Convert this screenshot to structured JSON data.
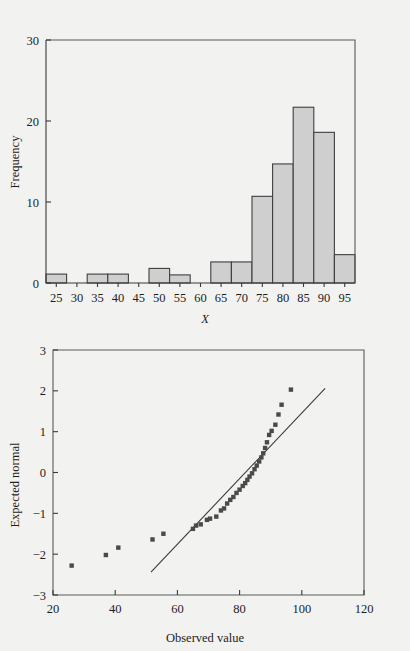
{
  "figure": {
    "background_color": "#f2f2f0",
    "bar_fill_color": "#cfcfcf",
    "bar_stroke_color": "#3f3f3f",
    "point_color": "#4a4a4a",
    "axis_color": "#3a3a3a"
  },
  "chart_data": [
    {
      "id": "histogram",
      "type": "bar",
      "title": "",
      "xlabel": "X",
      "ylabel": "Frequency",
      "xlim": [
        22.5,
        97.5
      ],
      "ylim": [
        0,
        30
      ],
      "grid": false,
      "legend": null,
      "xticks": [
        25,
        30,
        35,
        40,
        45,
        50,
        55,
        60,
        65,
        70,
        75,
        80,
        85,
        90,
        95
      ],
      "xticklabels": [
        "25",
        "30",
        "35",
        "40",
        "45",
        "50",
        "55",
        "60",
        "65",
        "70",
        "75",
        "80",
        "85",
        "90",
        "95"
      ],
      "yticks": [
        0,
        10,
        20,
        30
      ],
      "yticklabels": [
        "0",
        "10",
        "20",
        "30"
      ],
      "bin_width": 5,
      "bin_starts": [
        22.5,
        27.5,
        32.5,
        37.5,
        42.5,
        47.5,
        52.5,
        57.5,
        62.5,
        67.5,
        72.5,
        77.5,
        82.5,
        87.5,
        92.5
      ],
      "categories": [
        "25",
        "30",
        "35",
        "40",
        "45",
        "50",
        "55",
        "60",
        "65",
        "70",
        "75",
        "80",
        "85",
        "90",
        "95"
      ],
      "values": [
        1.1,
        0,
        1.1,
        1.1,
        0,
        1.8,
        1.0,
        0,
        2.6,
        2.6,
        10.7,
        14.7,
        21.7,
        18.6,
        3.5
      ]
    },
    {
      "id": "qq-plot",
      "type": "scatter",
      "title": "",
      "xlabel": "Observed value",
      "ylabel": "Expected normal",
      "xlim": [
        20,
        120
      ],
      "ylim": [
        -3,
        3
      ],
      "grid": false,
      "legend": null,
      "xticks": [
        20,
        40,
        60,
        80,
        100,
        120
      ],
      "xticklabels": [
        "20",
        "40",
        "60",
        "80",
        "100",
        "120"
      ],
      "yticks": [
        -3,
        -2,
        -1,
        0,
        1,
        2,
        3
      ],
      "yticklabels": [
        "−3",
        "−2",
        "−1",
        "0",
        "1",
        "2",
        "3"
      ],
      "points": [
        [
          26.0,
          -2.28
        ],
        [
          37.0,
          -2.02
        ],
        [
          41.0,
          -1.84
        ],
        [
          52.0,
          -1.64
        ],
        [
          55.5,
          -1.5
        ],
        [
          65.0,
          -1.38
        ],
        [
          66.0,
          -1.3
        ],
        [
          67.5,
          -1.27
        ],
        [
          69.5,
          -1.16
        ],
        [
          70.5,
          -1.13
        ],
        [
          72.5,
          -1.08
        ],
        [
          74.0,
          -0.93
        ],
        [
          75.0,
          -0.88
        ],
        [
          76.0,
          -0.76
        ],
        [
          77.0,
          -0.67
        ],
        [
          78.0,
          -0.6
        ],
        [
          79.0,
          -0.5
        ],
        [
          80.0,
          -0.42
        ],
        [
          81.0,
          -0.33
        ],
        [
          81.8,
          -0.26
        ],
        [
          82.5,
          -0.18
        ],
        [
          83.2,
          -0.1
        ],
        [
          84.0,
          -0.02
        ],
        [
          84.8,
          0.08
        ],
        [
          85.5,
          0.17
        ],
        [
          86.3,
          0.27
        ],
        [
          87.0,
          0.37
        ],
        [
          87.6,
          0.47
        ],
        [
          88.2,
          0.6
        ],
        [
          88.8,
          0.74
        ],
        [
          89.5,
          0.92
        ],
        [
          90.3,
          1.02
        ],
        [
          91.5,
          1.17
        ],
        [
          92.5,
          1.42
        ],
        [
          93.5,
          1.66
        ],
        [
          96.5,
          2.03
        ]
      ],
      "reference_line": {
        "x0": 51.5,
        "y0": -2.44,
        "x1": 107.5,
        "y1": 2.06
      }
    }
  ]
}
